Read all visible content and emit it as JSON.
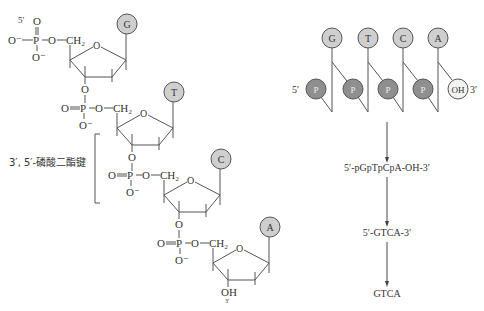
{
  "left_structure": {
    "five_prime_label": "5′",
    "three_prime_label": "3′",
    "terminal_oh": "OH",
    "phosphate": {
      "P": "P",
      "O": "O",
      "O_minus": "O⁻",
      "O_minus_left": "O⁻",
      "double_O": "O",
      "CH2": "CH₂"
    },
    "ring_oxygen": "O",
    "bases": [
      "G",
      "T",
      "C",
      "A"
    ],
    "bond_label": "3′, 5′-磷酸二酯键"
  },
  "right_scheme": {
    "bases": [
      "G",
      "T",
      "C",
      "A"
    ],
    "phosphate_label": "P",
    "terminal_label": "OH",
    "five_prime": "5′",
    "three_prime": "3′",
    "steps": [
      "5′-pGpTpCpA-OH-3′",
      "5′-GTCA-3′",
      "GTCA"
    ]
  },
  "colors": {
    "base_fill": "#cfcfcf",
    "phosphate_fill": "#8f8f8f",
    "oh_fill": "#f2f2f2",
    "line": "#555555"
  }
}
